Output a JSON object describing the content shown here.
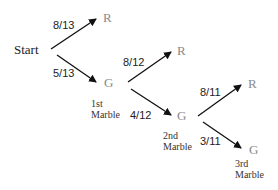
{
  "diagram": {
    "type": "probability-tree",
    "start_label": "Start",
    "levels": [
      {
        "stage_label_line1": "1st",
        "stage_label_line2": "Marble",
        "branches": [
          {
            "outcome": "R",
            "probability": "8/13"
          },
          {
            "outcome": "G",
            "probability": "5/13"
          }
        ]
      },
      {
        "stage_label_line1": "2nd",
        "stage_label_line2": "Marble",
        "branches": [
          {
            "outcome": "R",
            "probability": "8/12"
          },
          {
            "outcome": "G",
            "probability": "4/12"
          }
        ]
      },
      {
        "stage_label_line1": "3rd",
        "stage_label_line2": "Marble",
        "branches": [
          {
            "outcome": "R",
            "probability": "8/11"
          },
          {
            "outcome": "G",
            "probability": "3/11"
          }
        ]
      }
    ],
    "colors": {
      "arrow": "#111111",
      "node_text": "#8a8a8a",
      "label_text": "#222222"
    }
  }
}
